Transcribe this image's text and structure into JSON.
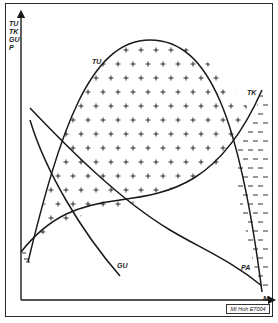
{
  "diagram": {
    "y_axis_labels": [
      "TU",
      "TK",
      "GU",
      "P"
    ],
    "x_axis_label": "M",
    "curves": {
      "tu": "TU",
      "tk": "TK",
      "gu": "GU",
      "pa": "PA"
    },
    "hatch_symbols": {
      "positive": "+",
      "negative": "–"
    },
    "reference_code": "MI Hoh E7004",
    "colors": {
      "line": "#1a1a1a",
      "background": "#ffffff"
    }
  }
}
